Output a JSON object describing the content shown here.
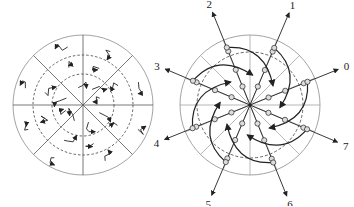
{
  "left_diagram": {
    "description": "Circular sector grid with random short vectors",
    "sectors": 8,
    "dashed_rings": 2
  },
  "right_diagram": {
    "description": "Circular grid with 8 labeled direction arrows and spiral vector paths",
    "spokes": 16,
    "dashed_rings": 1,
    "direction_labels": [
      "0",
      "1",
      "2",
      "3",
      "4",
      "5",
      "6",
      "7"
    ]
  },
  "colors": {
    "stroke": "#222222",
    "grid": "#999999"
  }
}
